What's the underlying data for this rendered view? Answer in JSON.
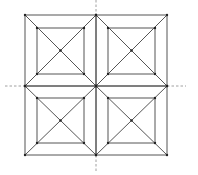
{
  "figure": {
    "colors": {
      "line": "#555555",
      "dash": "#888888",
      "background": "#ffffff"
    },
    "outer": {
      "x1": 25,
      "y1": 15,
      "x2": 167,
      "y2": 155
    },
    "center": {
      "x": 96,
      "y": 86
    },
    "cells": [
      {
        "name": "top-left",
        "x1": 25,
        "y1": 15,
        "x2": 96,
        "y2": 86,
        "inner": {
          "x1": 37,
          "y1": 28,
          "x2": 84,
          "y2": 74
        }
      },
      {
        "name": "top-right",
        "x1": 96,
        "y1": 15,
        "x2": 167,
        "y2": 86,
        "inner": {
          "x1": 108,
          "y1": 28,
          "x2": 155,
          "y2": 74
        }
      },
      {
        "name": "bottom-left",
        "x1": 25,
        "y1": 86,
        "x2": 96,
        "y2": 155,
        "inner": {
          "x1": 37,
          "y1": 98,
          "x2": 84,
          "y2": 143
        }
      },
      {
        "name": "bottom-right",
        "x1": 96,
        "y1": 86,
        "x2": 167,
        "y2": 155,
        "inner": {
          "x1": 108,
          "y1": 98,
          "x2": 155,
          "y2": 143
        }
      }
    ],
    "axes": {
      "horizontal": {
        "y": 86,
        "segments": [
          [
            5,
            25
          ],
          [
            167,
            186
          ]
        ]
      },
      "vertical": {
        "x": 96,
        "segments": [
          [
            0,
            15
          ],
          [
            155,
            173
          ]
        ]
      }
    }
  }
}
